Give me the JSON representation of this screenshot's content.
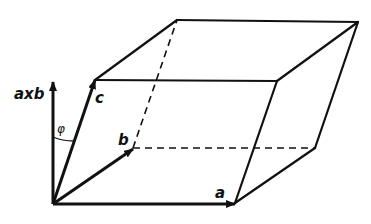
{
  "diagram": {
    "labels": {
      "a": "a",
      "b": "b",
      "c": "c",
      "axb": "axb",
      "phi": "φ"
    },
    "colors": {
      "stroke": "#111111",
      "background": "#ffffff"
    }
  }
}
